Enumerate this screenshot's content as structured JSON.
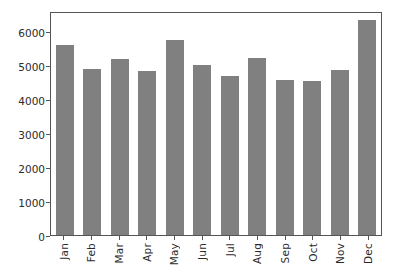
{
  "chart_data": {
    "type": "bar",
    "title": "",
    "xlabel": "",
    "ylabel": "",
    "categories": [
      "Jan",
      "Feb",
      "Mar",
      "Apr",
      "May",
      "Jun",
      "Jul",
      "Aug",
      "Sep",
      "Oct",
      "Nov",
      "Dec"
    ],
    "values": [
      5600,
      4900,
      5200,
      4830,
      5740,
      5010,
      4700,
      5210,
      4560,
      4530,
      4850,
      6350
    ],
    "ylim": [
      0,
      6600
    ],
    "yticks": [
      0,
      1000,
      2000,
      3000,
      4000,
      5000,
      6000
    ],
    "ytick_labels": [
      "0",
      "1000",
      "2000",
      "3000",
      "4000",
      "5000",
      "6000"
    ],
    "grid": false,
    "legend": null,
    "bar_color": "#808080",
    "axis_color": "#555555",
    "text_color": "#2b2b2b",
    "background": "#ffffff",
    "xtick_rotation": 90
  }
}
